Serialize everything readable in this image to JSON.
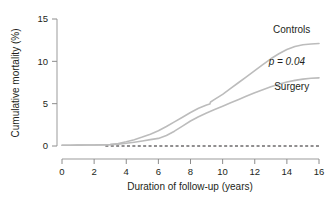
{
  "chart_data": {
    "type": "line",
    "title": "",
    "xlabel": "Duration of follow-up (years)",
    "ylabel": "Cumulative mortality (%)",
    "xlim": [
      0,
      16
    ],
    "ylim": [
      0,
      15
    ],
    "xticks": [
      0,
      2,
      4,
      6,
      8,
      10,
      12,
      14,
      16
    ],
    "xtick_labels": [
      "0",
      "2",
      "4",
      "6",
      "8",
      "10",
      "12",
      "14",
      "16"
    ],
    "yticks": [
      0,
      5,
      10,
      15
    ],
    "ytick_labels": [
      "0",
      "5",
      "10",
      "15"
    ],
    "grid": false,
    "legend_position": "inline-right",
    "annotations": [
      {
        "text": "Controls",
        "x": 14.3,
        "y": 13.4
      },
      {
        "text": "p = 0.04",
        "x": 14.0,
        "y": 9.6
      },
      {
        "text": "Surgery",
        "x": 14.3,
        "y": 6.6
      }
    ],
    "reference_line": {
      "y": 0,
      "style": "dashed",
      "color": "#231f20"
    },
    "series": [
      {
        "name": "Controls",
        "color": "#bcbcbc",
        "x": [
          0,
          0.5,
          1,
          1.5,
          2,
          2.5,
          3,
          3.5,
          4,
          4.5,
          5,
          5.5,
          6,
          6.5,
          7,
          7.5,
          8,
          8.5,
          9,
          9.2,
          9.25,
          9.5,
          10,
          10.5,
          11,
          11.5,
          12,
          12.5,
          13,
          13.5,
          14,
          14.5,
          15,
          15.5,
          16
        ],
        "values": [
          0.08,
          0.09,
          0.1,
          0.11,
          0.12,
          0.14,
          0.18,
          0.3,
          0.5,
          0.75,
          1.05,
          1.4,
          1.8,
          2.3,
          2.85,
          3.4,
          3.95,
          4.45,
          4.85,
          4.95,
          5.2,
          5.5,
          6.1,
          6.8,
          7.5,
          8.2,
          8.9,
          9.6,
          10.3,
          10.9,
          11.4,
          11.75,
          11.95,
          12.05,
          12.1
        ]
      },
      {
        "name": "Surgery",
        "color": "#bcbcbc",
        "x": [
          0,
          0.5,
          1,
          1.5,
          2,
          2.5,
          3,
          3.5,
          4,
          4.5,
          5,
          5.5,
          6,
          6.5,
          7,
          7.5,
          8,
          8.5,
          9,
          9.5,
          10,
          10.5,
          11,
          11.5,
          12,
          12.5,
          13,
          13.5,
          14,
          14.5,
          15,
          15.5,
          16
        ],
        "values": [
          0.08,
          0.09,
          0.1,
          0.11,
          0.12,
          0.13,
          0.16,
          0.22,
          0.32,
          0.45,
          0.6,
          0.75,
          0.9,
          1.25,
          1.75,
          2.35,
          2.95,
          3.45,
          3.9,
          4.3,
          4.7,
          5.1,
          5.5,
          5.9,
          6.3,
          6.65,
          7.0,
          7.3,
          7.55,
          7.75,
          7.9,
          8.0,
          8.05
        ]
      }
    ]
  },
  "axes": {
    "y_axis_label": "Cumulative mortality (%)",
    "x_axis_label": "Duration of follow-up (years)"
  },
  "colors": {
    "curve": "#bcbcbc",
    "axis": "#8c8c8c",
    "text": "#231f20",
    "reference": "#231f20",
    "background": "#ffffff"
  }
}
